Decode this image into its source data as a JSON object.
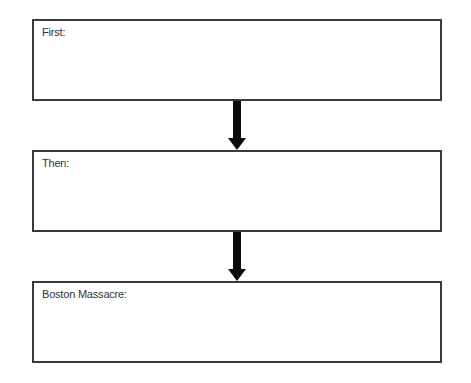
{
  "diagram": {
    "type": "sequence-flowchart",
    "boxes": [
      {
        "label": "First:"
      },
      {
        "label": "Then:"
      },
      {
        "label": "Boston Massacre:"
      }
    ],
    "arrows": [
      {
        "from": "First:",
        "to": "Then:"
      },
      {
        "from": "Then:",
        "to": "Boston Massacre:"
      }
    ],
    "colors": {
      "border": "#3a3a3a",
      "arrow": "#0a0a0a",
      "background": "#ffffff"
    }
  }
}
